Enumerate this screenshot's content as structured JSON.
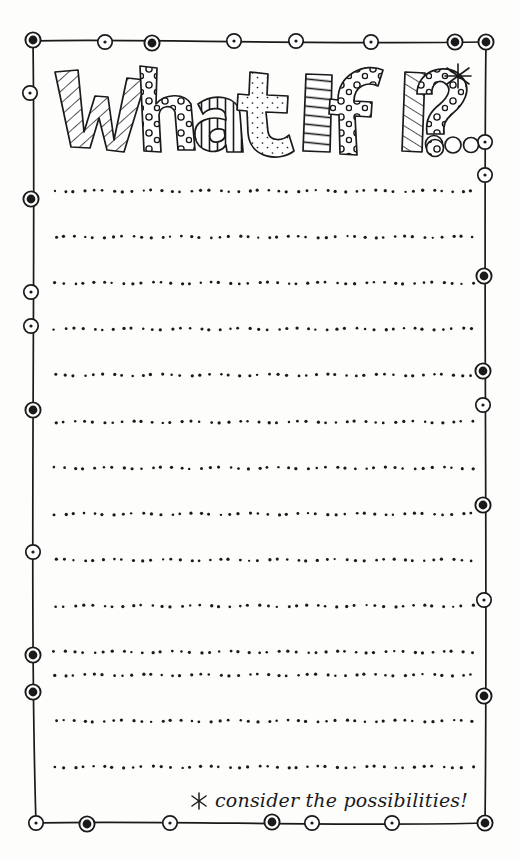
{
  "page": {
    "kind": "printable-journal-worksheet",
    "background_color": "#fdfdfc",
    "ink_color": "#1a1a1a",
    "width": 520,
    "height": 859
  },
  "title": {
    "text": "What If I... ?",
    "style": "hand-drawn doodle block letters",
    "letters": [
      {
        "char": "W",
        "fill": "diagonal-stripes"
      },
      {
        "char": "h",
        "fill": "polka-dots"
      },
      {
        "char": "a",
        "fill": "vertical-stripes"
      },
      {
        "char": "t",
        "fill": "speckles"
      },
      {
        "char": "I",
        "fill": "horizontal-stripes"
      },
      {
        "char": "f",
        "fill": "polka-dots"
      },
      {
        "char": "I",
        "fill": "diagonal-stripes"
      },
      {
        "char": ".",
        "fill": "open-circle"
      },
      {
        "char": ".",
        "fill": "open-circle"
      },
      {
        "char": ".",
        "fill": "open-circle"
      },
      {
        "char": "?",
        "fill": "polka-dots"
      }
    ],
    "asterisk": "*"
  },
  "footer": {
    "asterisk": "*",
    "text": "consider the possibilities!",
    "full_text": "* consider the possibilities!",
    "style": "cursive handwriting"
  },
  "frame": {
    "left": 33,
    "top": 40,
    "right": 486,
    "bottom": 823,
    "stroke_color": "#1a1a1a",
    "stroke_width": 1.6,
    "bead_note": "hand-drawn beaded border: circles alternating solid-filled and hollow-with-center-dot",
    "beads_top": [
      {
        "x": 33,
        "y": 40,
        "type": "filled"
      },
      {
        "x": 105,
        "y": 42,
        "type": "hollow"
      },
      {
        "x": 152,
        "y": 43,
        "type": "filled"
      },
      {
        "x": 234,
        "y": 41,
        "type": "hollow"
      },
      {
        "x": 296,
        "y": 41,
        "type": "hollow"
      },
      {
        "x": 371,
        "y": 42,
        "type": "hollow"
      },
      {
        "x": 455,
        "y": 42,
        "type": "filled"
      },
      {
        "x": 486,
        "y": 42,
        "type": "filled"
      }
    ],
    "beads_left": [
      {
        "x": 30,
        "y": 93,
        "type": "hollow"
      },
      {
        "x": 31,
        "y": 199,
        "type": "filled"
      },
      {
        "x": 31,
        "y": 292,
        "type": "hollow"
      },
      {
        "x": 31,
        "y": 326,
        "type": "hollow"
      },
      {
        "x": 33,
        "y": 410,
        "type": "filled"
      },
      {
        "x": 33,
        "y": 552,
        "type": "hollow"
      },
      {
        "x": 33,
        "y": 655,
        "type": "filled"
      },
      {
        "x": 33,
        "y": 692,
        "type": "filled"
      },
      {
        "x": 36,
        "y": 823,
        "type": "hollow"
      }
    ],
    "beads_right": [
      {
        "x": 485,
        "y": 142,
        "type": "hollow"
      },
      {
        "x": 485,
        "y": 175,
        "type": "hollow"
      },
      {
        "x": 484,
        "y": 276,
        "type": "filled"
      },
      {
        "x": 483,
        "y": 371,
        "type": "filled"
      },
      {
        "x": 483,
        "y": 405,
        "type": "hollow"
      },
      {
        "x": 483,
        "y": 505,
        "type": "filled"
      },
      {
        "x": 484,
        "y": 600,
        "type": "hollow"
      },
      {
        "x": 484,
        "y": 696,
        "type": "filled"
      },
      {
        "x": 485,
        "y": 823,
        "type": "filled"
      }
    ],
    "beads_bottom": [
      {
        "x": 87,
        "y": 824,
        "type": "filled"
      },
      {
        "x": 170,
        "y": 823,
        "type": "hollow"
      },
      {
        "x": 272,
        "y": 822,
        "type": "filled"
      },
      {
        "x": 312,
        "y": 823,
        "type": "hollow"
      },
      {
        "x": 392,
        "y": 823,
        "type": "hollow"
      }
    ]
  },
  "writing_lines": {
    "count": 14,
    "style": "dotted",
    "dot_color": "#1a1a1a",
    "x_start": 55,
    "x_end": 472,
    "y_positions": [
      191,
      237,
      283,
      329,
      375,
      422,
      468,
      514,
      560,
      606,
      652,
      675,
      721,
      767
    ]
  }
}
